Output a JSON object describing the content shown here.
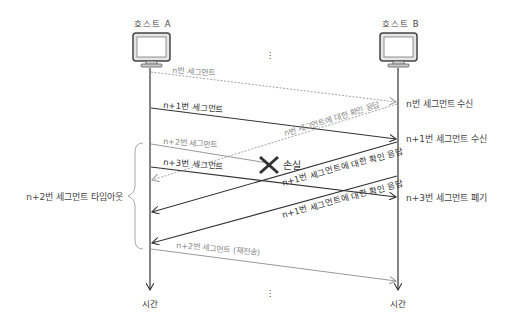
{
  "hosts": {
    "a": {
      "label": "호스트 A"
    },
    "b": {
      "label": "호스트 B"
    }
  },
  "time_label_a": "시간",
  "time_label_b": "시간",
  "ellipsis": "⋮",
  "messages": [
    {
      "id": "seg-n",
      "label": "n번 세그먼트",
      "style": "dashed-gray",
      "direction": "A→B"
    },
    {
      "id": "seg-n1",
      "label": "n+1번 세그먼트",
      "style": "solid-dark",
      "direction": "A→B"
    },
    {
      "id": "ack-n",
      "label": "n번 세그먼트에 대한 확인 응답",
      "style": "dashed-gray",
      "direction": "B→A"
    },
    {
      "id": "seg-n2",
      "label": "n+2번 세그먼트",
      "style": "solid-gray",
      "direction": "A→B (lost)"
    },
    {
      "id": "seg-n3",
      "label": "n+3번 세그먼트",
      "style": "solid-dark",
      "direction": "A→B"
    },
    {
      "id": "ack-n1-a",
      "label": "n+1번 세그먼트에 대한 확인 응답",
      "style": "solid-dark",
      "direction": "B→A"
    },
    {
      "id": "ack-n1-b",
      "label": "n+1번 세그먼트에 대한 확인 응답",
      "style": "solid-dark",
      "direction": "B→A"
    },
    {
      "id": "seg-n2-retx",
      "label": "n+2번 세그먼트 (재전송)",
      "style": "solid-gray",
      "direction": "A→B"
    }
  ],
  "loss_label": "손실",
  "host_b_events": [
    "n번 세그먼트 수신",
    "n+1번 세그먼트 수신",
    "n+3번 세그먼트 폐기"
  ],
  "timeout_label": "n+2번 세그먼트 타임아웃",
  "colors": {
    "dark": "#333333",
    "gray": "#999999",
    "monitor_fill": "#e6e6e6"
  }
}
